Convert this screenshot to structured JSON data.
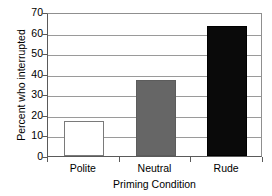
{
  "chart_data": {
    "type": "bar",
    "title": "",
    "categories": [
      "Polite",
      "Neutral",
      "Rude"
    ],
    "values": [
      17,
      37,
      63
    ],
    "xlabel": "Priming Condition",
    "ylabel": "Percent who interrupted",
    "ylim": [
      0,
      70
    ],
    "yticks": [
      0,
      10,
      20,
      30,
      40,
      50,
      60,
      70
    ],
    "ytick_labels": [
      "0",
      "10",
      "20",
      "30",
      "40",
      "50",
      "60",
      "70"
    ],
    "grid": "horizontal",
    "legend": "none",
    "bar_colors": [
      "#ffffff",
      "#666666",
      "#0a0a0a"
    ],
    "bar_border_color": "#6b6b6b",
    "gridline_color": "#9a9a9a",
    "axis_color": "#5a5a5a",
    "background": "#ffffff"
  }
}
